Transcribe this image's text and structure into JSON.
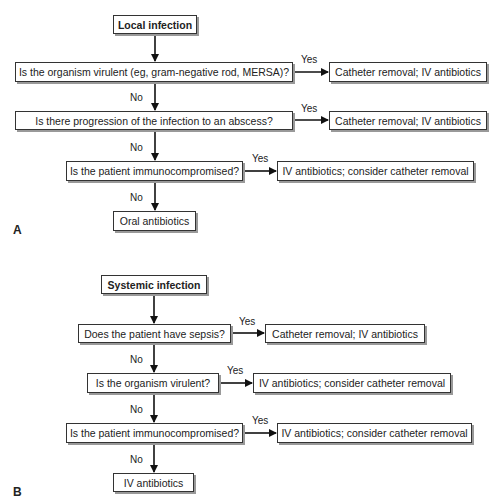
{
  "panel_a": {
    "label": "A",
    "start": "Local infection",
    "questions": [
      {
        "text": "Is the organism virulent (eg, gram-negative rod, MERSA)?",
        "yes_label": "Yes",
        "yes_result": "Catheter removal; IV antibiotics",
        "no_label": "No"
      },
      {
        "text": "Is there progression of the infection to an abscess?",
        "yes_label": "Yes",
        "yes_result": "Catheter removal; IV antibiotics",
        "no_label": "No"
      },
      {
        "text": "Is the patient immunocompromised?",
        "yes_label": "Yes",
        "yes_result": "IV antibiotics; consider catheter removal",
        "no_label": "No"
      }
    ],
    "end": "Oral antibiotics"
  },
  "panel_b": {
    "label": "B",
    "start": "Systemic infection",
    "questions": [
      {
        "text": "Does the patient have sepsis?",
        "yes_label": "Yes",
        "yes_result": "Catheter removal; IV antibiotics",
        "no_label": "No"
      },
      {
        "text": "Is the organism virulent?",
        "yes_label": "Yes",
        "yes_result": "IV antibiotics; consider catheter removal",
        "no_label": "No"
      },
      {
        "text": "Is the patient immunocompromised?",
        "yes_label": "Yes",
        "yes_result": "IV antibiotics; consider catheter removal",
        "no_label": "No"
      }
    ],
    "end": "IV antibiotics"
  }
}
